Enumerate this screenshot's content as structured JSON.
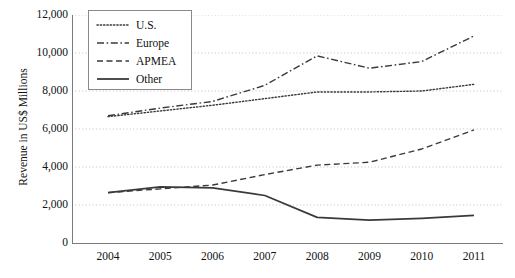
{
  "chart_data": {
    "type": "line",
    "title": "",
    "xlabel": "",
    "ylabel": "Revenue in US$ Millions",
    "x": [
      2004,
      2005,
      2006,
      2007,
      2008,
      2009,
      2010,
      2011
    ],
    "categories": [
      "2004",
      "2005",
      "2006",
      "2007",
      "2008",
      "2009",
      "2010",
      "2011"
    ],
    "ylim": [
      0,
      12000
    ],
    "xlim": [
      2004,
      2011
    ],
    "ytick_labels": [
      "12,000",
      "10,000",
      "8,000",
      "6,000",
      "4,000",
      "2,000",
      "0"
    ],
    "ytick_values": [
      12000,
      10000,
      8000,
      6000,
      4000,
      2000,
      0
    ],
    "ytick_step": 2000,
    "grid": true,
    "grid_style": "dotted-horizontal",
    "legend_position": "top-left-inside",
    "series": [
      {
        "name": "U.S.",
        "style": "dotted",
        "color": "#3a3a3a",
        "values": [
          6650,
          6950,
          7250,
          7600,
          7950,
          7950,
          8000,
          8350
        ]
      },
      {
        "name": "Europe",
        "style": "dash-dot",
        "color": "#3a3a3a",
        "values": [
          6700,
          7100,
          7450,
          8300,
          9850,
          9200,
          9550,
          10900
        ]
      },
      {
        "name": "APMEA",
        "style": "dashed",
        "color": "#3a3a3a",
        "values": [
          2650,
          2850,
          3050,
          3600,
          4100,
          4250,
          4950,
          5950
        ]
      },
      {
        "name": "Other",
        "style": "solid",
        "color": "#3a3a3a",
        "values": [
          2650,
          2950,
          2900,
          2500,
          1350,
          1200,
          1300,
          1450
        ]
      }
    ]
  },
  "legend": {
    "items": [
      {
        "label": "U.S.",
        "style": "dotted"
      },
      {
        "label": "Europe",
        "style": "dash-dot"
      },
      {
        "label": "APMEA",
        "style": "dashed"
      },
      {
        "label": "Other",
        "style": "solid"
      }
    ]
  },
  "colors": {
    "line": "#3a3a3a",
    "axis": "#7a7a7a",
    "grid": "#c9c9c9",
    "legend_border": "#8a8a8a",
    "text": "#111111",
    "background": "#ffffff"
  }
}
